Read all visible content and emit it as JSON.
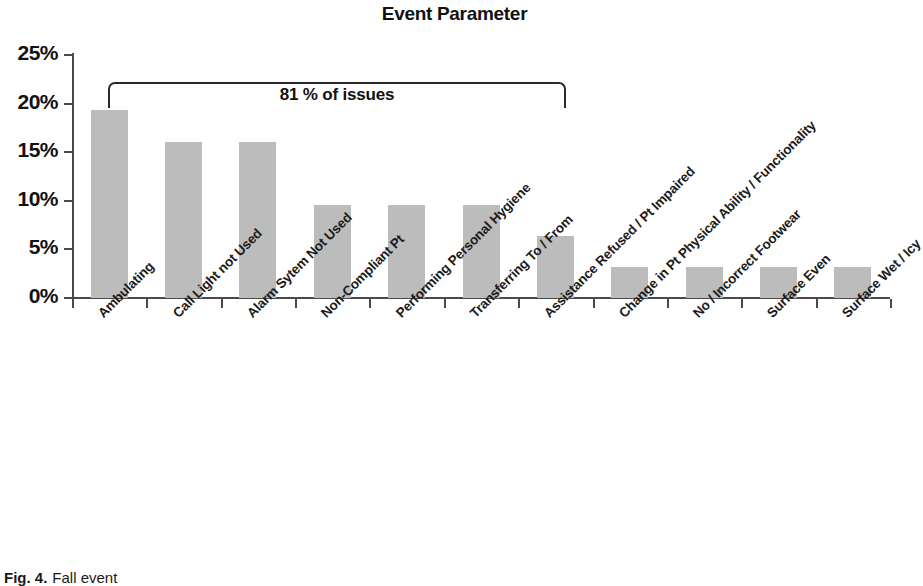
{
  "figure": {
    "caption_label": "Fig. 4.",
    "caption_text": "Fall event"
  },
  "chart_data": {
    "type": "bar",
    "title": "Event Parameter",
    "xlabel": "",
    "ylabel": "",
    "ylim": [
      0,
      25
    ],
    "ytick_labels": [
      "0%",
      "5%",
      "10%",
      "15%",
      "20%",
      "25%"
    ],
    "ytick_values": [
      0,
      5,
      10,
      15,
      20,
      25
    ],
    "grid": false,
    "legend": null,
    "bar_color": "#bcbcbc",
    "categories": [
      "Ambulating",
      "Call Light not Used",
      "Alarm Sytem Not Used",
      "Non-Compliant Pt",
      "Performing Personal Hygiene",
      "Transferring To / From",
      "Assistance Refused / Pt Impaired",
      "Change in Pt Physical Ability / Functionality",
      "No / Incorrect Footwear",
      "Surface Even",
      "Surface Wet / Icy"
    ],
    "values": [
      19.3,
      16.0,
      16.0,
      9.6,
      9.6,
      9.6,
      6.4,
      3.2,
      3.2,
      3.2,
      3.2
    ],
    "annotations": [
      {
        "text": "81 % of issues",
        "type": "bracket",
        "spans_categories": [
          "Ambulating",
          "Call Light not Used",
          "Alarm Sytem Not Used",
          "Non-Compliant Pt",
          "Performing Personal Hygiene",
          "Transferring To / From"
        ]
      }
    ]
  }
}
